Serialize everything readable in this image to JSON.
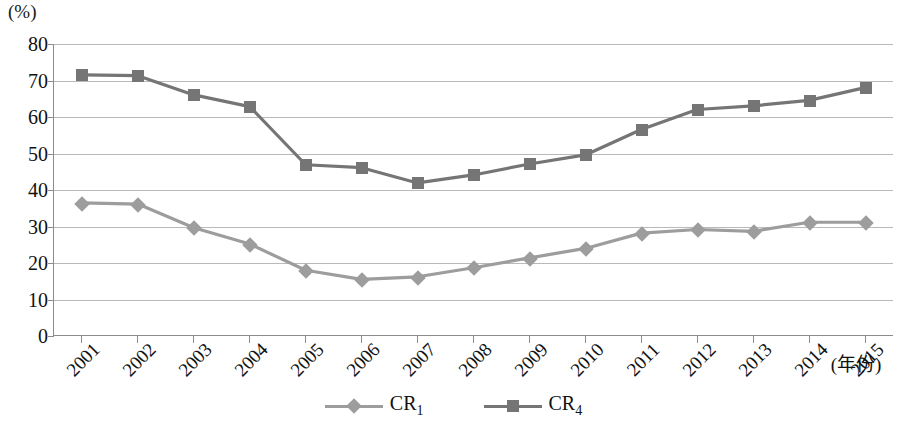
{
  "axis": {
    "unit_label": "(%)",
    "x_title": "(年份)",
    "y_ticks": [
      "80",
      "70",
      "60",
      "50",
      "40",
      "30",
      "20",
      "10",
      "0"
    ]
  },
  "legend": {
    "items": [
      {
        "name": "CR",
        "sub": "1",
        "marker": "diamond-marker",
        "color": "#9d9d9d"
      },
      {
        "name": "CR",
        "sub": "4",
        "marker": "square-marker",
        "color": "#757575"
      }
    ]
  },
  "chart_data": {
    "type": "line",
    "title": "",
    "xlabel": "(年份)",
    "ylabel": "(%)",
    "ylim": [
      0,
      80
    ],
    "ytick_step": 10,
    "grid": "horizontal",
    "legend_position": "bottom-center",
    "categories": [
      "2001",
      "2002",
      "2003",
      "2004",
      "2005",
      "2006",
      "2007",
      "2008",
      "2009",
      "2010",
      "2011",
      "2012",
      "2013",
      "2014",
      "2015"
    ],
    "series": [
      {
        "name": "CR1",
        "marker": "diamond",
        "color": "#9d9d9d",
        "values": [
          36.3,
          36.0,
          29.5,
          25.0,
          17.8,
          15.3,
          16.0,
          18.5,
          21.2,
          23.8,
          28.0,
          29.0,
          28.5,
          31.0,
          31.0
        ]
      },
      {
        "name": "CR4",
        "marker": "square",
        "color": "#757575",
        "values": [
          71.5,
          71.3,
          66.0,
          62.8,
          46.8,
          46.0,
          41.8,
          44.0,
          47.0,
          49.5,
          56.5,
          62.0,
          63.0,
          64.5,
          68.0
        ]
      }
    ]
  }
}
